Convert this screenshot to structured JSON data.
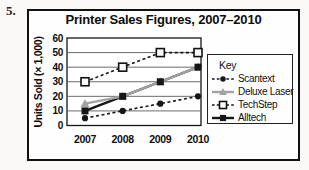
{
  "page_label": "5.",
  "chart": {
    "title": "Printer Sales Figures, 2007–2010",
    "ylabel": "Units Sold (× 1,000)"
  },
  "legend": {
    "title": "Key",
    "items": [
      "Scantext",
      "Deluxe Laser",
      "TechStep",
      "Alltech"
    ]
  },
  "chart_data": {
    "type": "line",
    "title": "Printer Sales Figures, 2007–2010",
    "xlabel": "",
    "ylabel": "Units Sold (× 1,000)",
    "x": [
      "2007",
      "2008",
      "2009",
      "2010"
    ],
    "ylim": [
      0,
      60
    ],
    "yticks": [
      0,
      10,
      20,
      30,
      40,
      50,
      60
    ],
    "grid": "horizontal",
    "legend_position": "right",
    "legend_title": "Key",
    "colors": {
      "black": "#161616",
      "gray": "#a3a3a3",
      "grid": "#5a5a5a"
    },
    "series": [
      {
        "name": "Scantext",
        "values": [
          5,
          10,
          15,
          20
        ],
        "color": "#161616",
        "line": "dashed",
        "marker": "circle"
      },
      {
        "name": "Deluxe Laser",
        "values": [
          15,
          20,
          30,
          40
        ],
        "color": "#a3a3a3",
        "line": "solid",
        "marker": "triangle"
      },
      {
        "name": "TechStep",
        "values": [
          30,
          40,
          50,
          50
        ],
        "color": "#161616",
        "line": "dashed",
        "marker": "square-open"
      },
      {
        "name": "Alltech",
        "values": [
          10,
          20,
          30,
          40
        ],
        "color": "#161616",
        "line": "solid",
        "marker": "square"
      }
    ]
  }
}
